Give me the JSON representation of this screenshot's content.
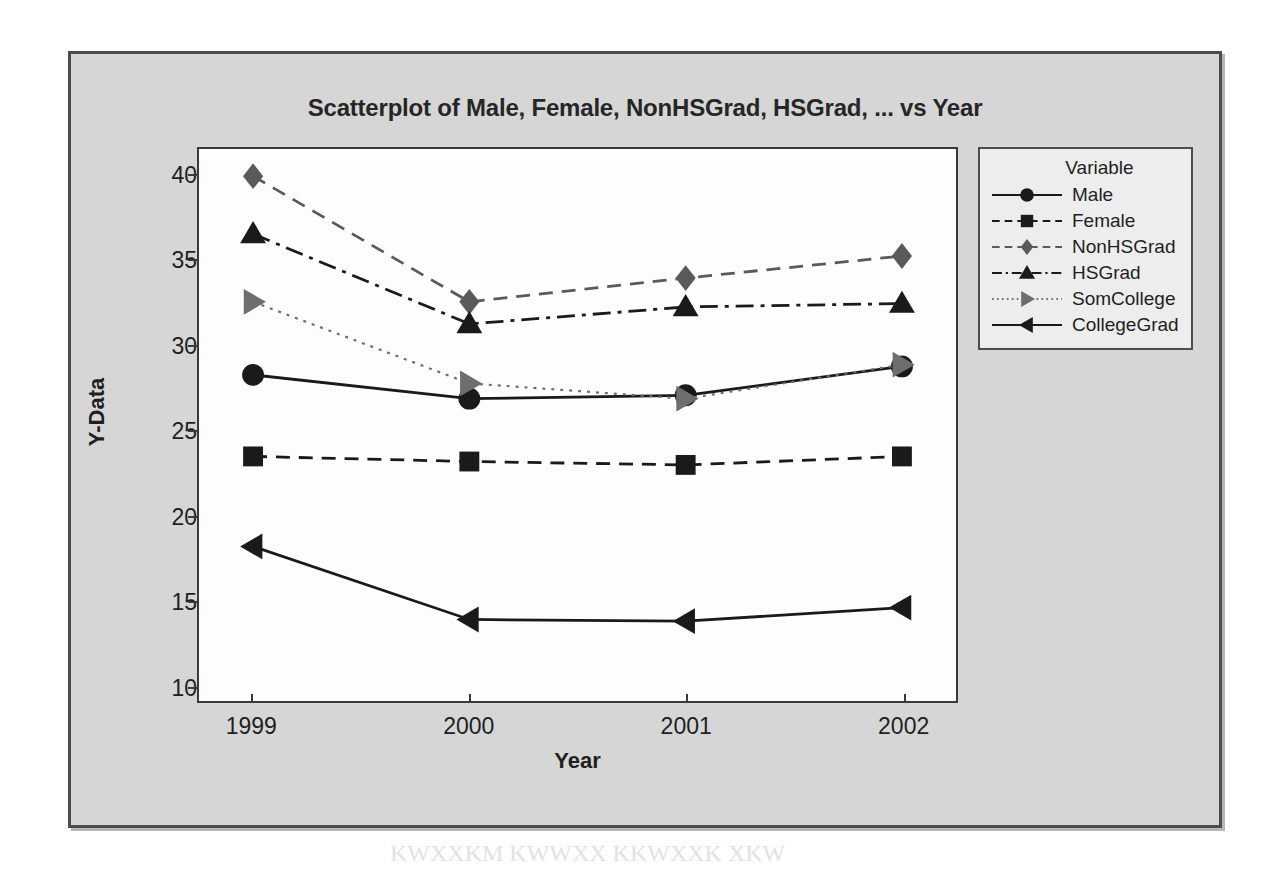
{
  "chart_data": {
    "type": "line",
    "title": "Scatterplot of Male, Female, NonHSGrad, HSGrad, ... vs Year",
    "xlabel": "Year",
    "ylabel": "Y-Data",
    "categories": [
      "1999",
      "2000",
      "2001",
      "2002"
    ],
    "x": [
      1999,
      2000,
      2001,
      2002
    ],
    "xlim": [
      1998.75,
      2002.25
    ],
    "ylim": [
      9.0,
      41.5
    ],
    "yticks": [
      10,
      15,
      20,
      25,
      30,
      35,
      40
    ],
    "xticks": [
      "1999",
      "2000",
      "2001",
      "2002"
    ],
    "grid": false,
    "legend_position": "right-outside",
    "legend_title": "Variable",
    "series": [
      {
        "name": "Male",
        "values": [
          28.2,
          26.8,
          27.0,
          28.7
        ],
        "marker": "circle",
        "linestyle": "solid",
        "color": "#1a1a1a"
      },
      {
        "name": "Female",
        "values": [
          23.4,
          23.1,
          22.9,
          23.4
        ],
        "marker": "square",
        "linestyle": "dashed",
        "color": "#1a1a1a"
      },
      {
        "name": "NonHSGrad",
        "values": [
          39.9,
          32.5,
          33.9,
          35.2
        ],
        "marker": "diamond",
        "linestyle": "dashed",
        "color": "#5a5a5a"
      },
      {
        "name": "HSGrad",
        "values": [
          36.5,
          31.2,
          32.2,
          32.4
        ],
        "marker": "triangle-up",
        "linestyle": "dashdot",
        "color": "#1a1a1a"
      },
      {
        "name": "SomCollege",
        "values": [
          32.5,
          27.7,
          26.8,
          28.8
        ],
        "marker": "triangle-right",
        "linestyle": "dotted",
        "color": "#6e6e6e"
      },
      {
        "name": "CollegeGrad",
        "values": [
          18.1,
          13.8,
          13.7,
          14.5
        ],
        "marker": "triangle-left",
        "linestyle": "solid",
        "color": "#1a1a1a"
      }
    ]
  },
  "background_bleed": {
    "line1": "WKXXOKHXKWWXX",
    "line2": "NNXX KNXW KKXXM",
    "line3": "KWXXK",
    "line4": "KK KWXKM KX KWWXK",
    "line5": "XXK KWWXXM KKWX XKWKK",
    "line6": "MKWXXK KWWX XKWXXM XKWK",
    "line7": "KWXXKM KWWXX KKWXXK XKW"
  }
}
